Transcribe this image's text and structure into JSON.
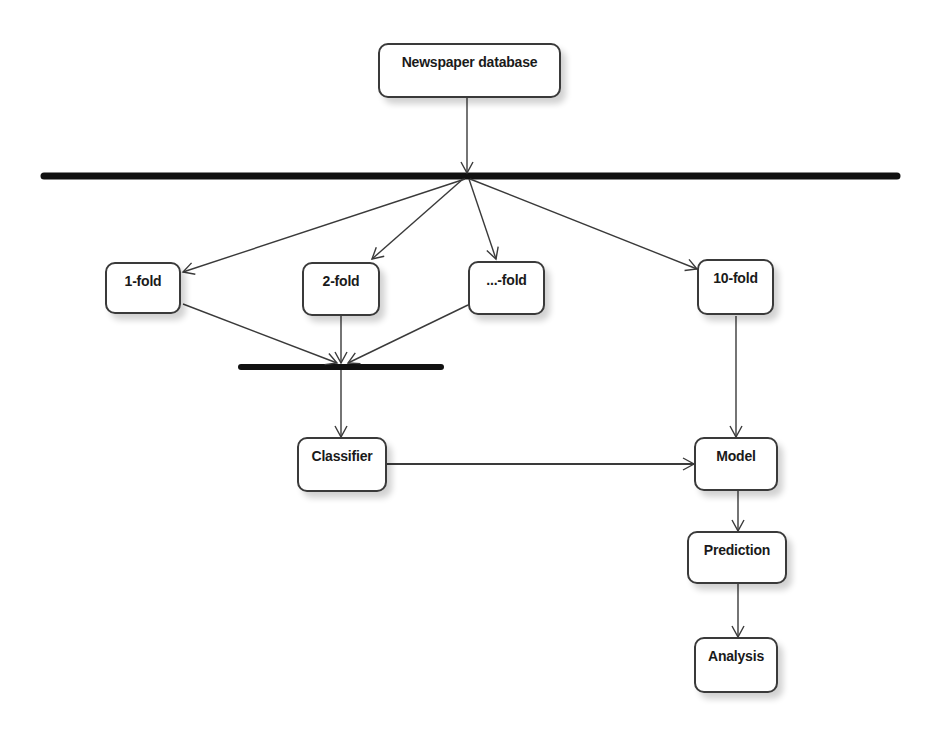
{
  "diagram": {
    "type": "activity-diagram",
    "nodes": {
      "source": "Newspaper database",
      "fold1": "1-fold",
      "fold2": "2-fold",
      "foldn": "...-fold",
      "fold10": "10-fold",
      "classifier": "Classifier",
      "model": "Model",
      "prediction": "Prediction",
      "analysis": "Analysis"
    },
    "edges": [
      {
        "from": "Newspaper database",
        "to": "fork-bar"
      },
      {
        "from": "fork-bar",
        "to": "1-fold"
      },
      {
        "from": "fork-bar",
        "to": "2-fold"
      },
      {
        "from": "fork-bar",
        "to": "...-fold"
      },
      {
        "from": "fork-bar",
        "to": "10-fold"
      },
      {
        "from": "1-fold",
        "to": "join-bar"
      },
      {
        "from": "2-fold",
        "to": "join-bar"
      },
      {
        "from": "...-fold",
        "to": "join-bar"
      },
      {
        "from": "join-bar",
        "to": "Classifier"
      },
      {
        "from": "10-fold",
        "to": "Model"
      },
      {
        "from": "Classifier",
        "to": "Model"
      },
      {
        "from": "Model",
        "to": "Prediction"
      },
      {
        "from": "Prediction",
        "to": "Analysis"
      }
    ],
    "colors": {
      "line": "#3a3a3a",
      "bar": "#111111",
      "node_fill": "#ffffff"
    }
  }
}
